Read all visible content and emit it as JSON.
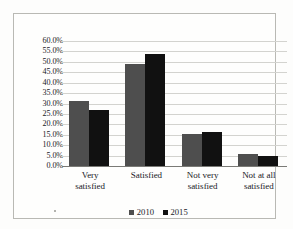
{
  "chart_data": {
    "type": "bar",
    "title": "",
    "subtitle": "",
    "xlabel": "",
    "ylabel": "",
    "categories": [
      "Very satisfied",
      "Satisfied",
      "Not very satisfied",
      "Not at all satisfied"
    ],
    "category_lines": [
      [
        "Very",
        "satisfied"
      ],
      [
        "Satisfied"
      ],
      [
        "Not very",
        "satisfied"
      ],
      [
        "Not at all",
        "satisfied"
      ]
    ],
    "series": [
      {
        "name": "2010",
        "color": "#4e4e4e",
        "values": [
          31.0,
          48.8,
          15.3,
          5.8
        ]
      },
      {
        "name": "2015",
        "color": "#111111",
        "values": [
          26.7,
          54.0,
          16.2,
          4.7
        ]
      }
    ],
    "ylim": [
      0,
      60
    ],
    "ytick_step": 5,
    "ytick_labels": [
      "0.0%",
      "5.0%",
      "10.0%",
      "15.0%",
      "20.0%",
      "25.0%",
      "30.0%",
      "35.0%",
      "40.0%",
      "45.0%",
      "50.0%",
      "55.0%",
      "60.0%"
    ],
    "ytick_values": [
      0,
      5,
      10,
      15,
      20,
      25,
      30,
      35,
      40,
      45,
      50,
      55,
      60
    ],
    "grid": true,
    "grid_axis": "y",
    "legend": true,
    "legend_position": "bottom",
    "value_labels": false
  },
  "colors": {
    "series_2010": "#4e4e4e",
    "series_2015": "#111111",
    "gridline": "#d3d3cf",
    "axis": "#7a7a76",
    "frame": "#b9b9b4",
    "background": "#fefefd",
    "text": "#20201f"
  }
}
